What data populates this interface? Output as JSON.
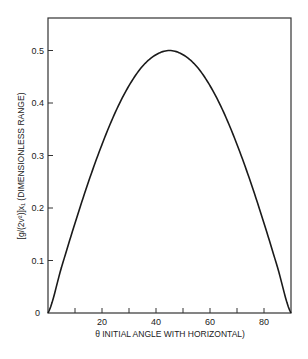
{
  "chart_data": {
    "type": "line",
    "title": "",
    "xlabel": "θ INITIAL ANGLE WITH HORIZONTAL)",
    "ylabel": "[g/(2v²)]x₁ (DIMENSIONLESS RANGE)",
    "xlim": [
      0,
      90
    ],
    "ylim": [
      0,
      0.55
    ],
    "x_ticks": [
      10,
      20,
      30,
      40,
      50,
      60,
      70,
      80
    ],
    "x_tick_labels": [
      "20",
      "40",
      "60",
      "80"
    ],
    "y_ticks": [
      0,
      0.1,
      0.2,
      0.3,
      0.4,
      0.5
    ],
    "y_tick_labels": [
      "0",
      "0.1",
      "0.2",
      "0.3",
      "0.4",
      "0.5"
    ],
    "grid": false,
    "legend": null,
    "series": [
      {
        "name": "dimensionless range = 0.5·sin(2θ)",
        "x": [
          0,
          5,
          10,
          15,
          20,
          25,
          30,
          35,
          40,
          45,
          50,
          55,
          60,
          65,
          70,
          75,
          80,
          85,
          90
        ],
        "values": [
          0,
          0.087,
          0.171,
          0.25,
          0.321,
          0.383,
          0.433,
          0.47,
          0.492,
          0.5,
          0.492,
          0.47,
          0.433,
          0.383,
          0.321,
          0.25,
          0.171,
          0.087,
          0
        ]
      }
    ],
    "colors": {
      "line": "#1a1a1a",
      "axes": "#333333"
    }
  },
  "labels": {
    "y0": "0",
    "y1": "0.1",
    "y2": "0.2",
    "y3": "0.3",
    "y4": "0.4",
    "y5": "0.5",
    "x20": "20",
    "x40": "40",
    "x60": "60",
    "x80": "80",
    "xlabel": "θ INITIAL ANGLE WITH HORIZONTAL)",
    "ylabel": "[g/(2v²)]x₁ (DIMENSIONLESS RANGE)"
  }
}
